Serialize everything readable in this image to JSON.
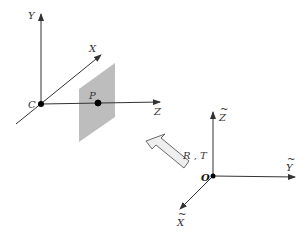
{
  "diagram": {
    "camera_frame": {
      "origin_label": "C",
      "axes": [
        {
          "name": "y-axis",
          "label": "Y"
        },
        {
          "name": "x-axis",
          "label": "X"
        },
        {
          "name": "z-axis",
          "label": "Z"
        }
      ],
      "point_label": "P"
    },
    "world_frame": {
      "origin_label": "O",
      "axes": [
        {
          "name": "z-tilde-axis",
          "label": "Z",
          "accent": "~"
        },
        {
          "name": "y-tilde-axis",
          "label": "Y",
          "accent": "~"
        },
        {
          "name": "x-tilde-axis",
          "label": "X",
          "accent": "~"
        }
      ]
    },
    "transform_label": "R , T",
    "colors": {
      "axis": "#333333",
      "image_plane": "#bdbdbd",
      "arrow_fill": "#eeeeee",
      "point": "#000000"
    }
  }
}
